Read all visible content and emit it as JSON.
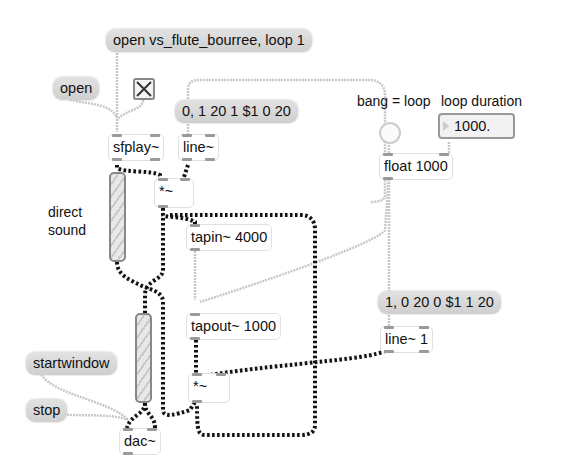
{
  "patch": {
    "messages": {
      "open_file": "open vs_flute_bourree, loop 1",
      "open": "open",
      "line_env_in": "0, 1 20 1 $1 0 20",
      "line_env_out": "1, 0 20 0 $1 1 20",
      "startwindow": "startwindow",
      "stop": "stop"
    },
    "objects": {
      "sfplay": "sfplay~",
      "line": "line~",
      "mult1": "*~",
      "tapin": "tapin~ 4000",
      "tapout": "tapout~ 1000",
      "mult2": "*~",
      "float": "float 1000",
      "line1": "line~ 1",
      "dac": "dac~"
    },
    "comments": {
      "direct_sound": "direct\nsound",
      "bang_loop": "bang = loop",
      "loop_duration": "loop duration"
    },
    "number_box": {
      "value": "1000."
    },
    "toggle": {
      "state": "on"
    }
  }
}
